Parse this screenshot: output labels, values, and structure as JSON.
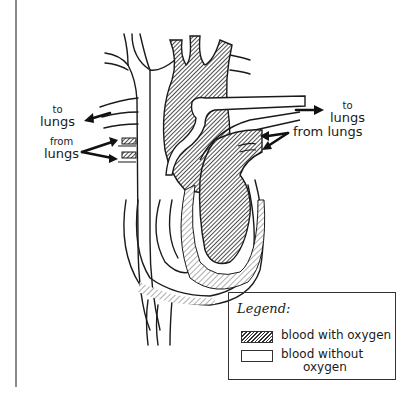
{
  "diagram": {
    "labels": {
      "left_to_lungs": {
        "line1": "to",
        "line2": "lungs"
      },
      "left_from_lungs": {
        "line1": "from",
        "line2": "lungs"
      },
      "right_to_lungs": {
        "line1": "to",
        "line2": "lungs"
      },
      "right_from_lungs": "from lungs"
    }
  },
  "legend": {
    "title": "Legend:",
    "items": [
      {
        "swatch": "hatched",
        "label": "blood with oxygen",
        "label2": ""
      },
      {
        "swatch": "plain",
        "label": "blood without",
        "label2": "oxygen"
      }
    ]
  },
  "colors": {
    "ink": "#1a1a1a",
    "rule": "#8a8a8a",
    "background": "#ffffff"
  }
}
